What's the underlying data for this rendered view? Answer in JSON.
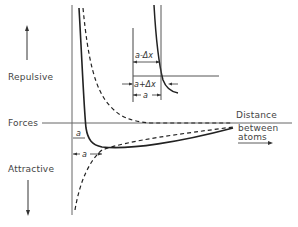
{
  "diagram": {
    "labels": {
      "repulsive": "Repulsive",
      "forces": "Forces",
      "attractive": "Attractive",
      "distance": "Distance",
      "between": "between",
      "atoms": "atoms"
    },
    "annotations": {
      "a_small": "a",
      "a_main": "a",
      "inset_a_minus": "a-Δx",
      "inset_a_plus": "a+Δx",
      "inset_a": "a"
    },
    "curves": [
      {
        "name": "net-force",
        "style": "solid"
      },
      {
        "name": "repulsive-force",
        "style": "dashed"
      },
      {
        "name": "attractive-force",
        "style": "dashed"
      }
    ],
    "colors": {
      "line": "#222222",
      "axis": "#555555"
    }
  }
}
